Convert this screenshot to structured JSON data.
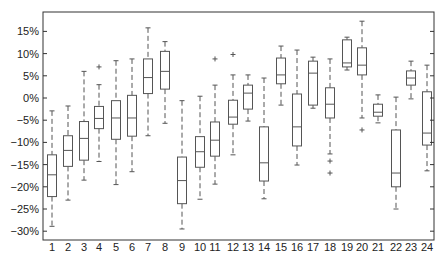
{
  "chart_data": {
    "type": "boxplot",
    "title": "",
    "xlabel": "",
    "ylabel": "",
    "ylim": [
      -32,
      18.5
    ],
    "yticks": [
      15,
      10,
      5,
      0,
      -5,
      -10,
      -15,
      -20,
      -25,
      -30
    ],
    "ytick_labels": [
      "15%",
      "10%",
      "5%",
      "0%",
      "-5%",
      "-10%",
      "-15%",
      "-20%",
      "-25%",
      "-30%"
    ],
    "grid": false,
    "legend": null,
    "categories": [
      "1",
      "2",
      "3",
      "4",
      "5",
      "6",
      "7",
      "8",
      "9",
      "10",
      "11",
      "12",
      "13",
      "14",
      "15",
      "16",
      "17",
      "18",
      "19",
      "20",
      "21",
      "22",
      "23",
      "24"
    ],
    "boxes": [
      {
        "label": "1",
        "whisker_low": -28.9,
        "q1": -22.2,
        "median": -17.3,
        "q3": -12.8,
        "whisker_high": -2.9,
        "outliers": []
      },
      {
        "label": "2",
        "whisker_low": -23.0,
        "q1": -15.4,
        "median": -11.8,
        "q3": -8.5,
        "whisker_high": -1.8,
        "outliers": []
      },
      {
        "label": "3",
        "whisker_low": -18.5,
        "q1": -14.0,
        "median": -9.1,
        "q3": -5.3,
        "whisker_high": 6.0,
        "outliers": []
      },
      {
        "label": "4",
        "whisker_low": -14.3,
        "q1": -6.9,
        "median": -4.6,
        "q3": -1.9,
        "whisker_high": 3.0,
        "outliers": [
          7.0
        ]
      },
      {
        "label": "5",
        "whisker_low": -19.5,
        "q1": -9.3,
        "median": -4.5,
        "q3": -0.6,
        "whisker_high": 8.4,
        "outliers": []
      },
      {
        "label": "6",
        "whisker_low": -16.6,
        "q1": -8.6,
        "median": -4.5,
        "q3": 0.6,
        "whisker_high": 8.8,
        "outliers": []
      },
      {
        "label": "7",
        "whisker_low": -8.5,
        "q1": 1.0,
        "median": 4.6,
        "q3": 8.8,
        "whisker_high": 15.8,
        "outliers": []
      },
      {
        "label": "8",
        "whisker_low": -5.7,
        "q1": 2.0,
        "median": 6.0,
        "q3": 10.5,
        "whisker_high": 12.7,
        "outliers": []
      },
      {
        "label": "9",
        "whisker_low": -29.5,
        "q1": -23.8,
        "median": -18.6,
        "q3": -13.3,
        "whisker_high": -0.6,
        "outliers": []
      },
      {
        "label": "10",
        "whisker_low": -22.8,
        "q1": -15.6,
        "median": -12.1,
        "q3": -8.7,
        "whisker_high": 0.4,
        "outliers": []
      },
      {
        "label": "11",
        "whisker_low": -19.4,
        "q1": -13.1,
        "median": -9.5,
        "q3": -5.4,
        "whisker_high": 2.9,
        "outliers": [
          8.8
        ]
      },
      {
        "label": "12",
        "whisker_low": -12.8,
        "q1": -5.9,
        "median": -4.3,
        "q3": -0.5,
        "whisker_high": 5.2,
        "outliers": [
          9.8
        ]
      },
      {
        "label": "13",
        "whisker_low": -5.2,
        "q1": -2.5,
        "median": 1.1,
        "q3": 2.9,
        "whisker_high": 5.2,
        "outliers": []
      },
      {
        "label": "14",
        "whisker_low": -22.7,
        "q1": -18.7,
        "median": -14.6,
        "q3": -6.5,
        "whisker_high": 4.5,
        "outliers": []
      },
      {
        "label": "15",
        "whisker_low": -1.6,
        "q1": 3.2,
        "median": 5.2,
        "q3": 9.0,
        "whisker_high": 11.7,
        "outliers": []
      },
      {
        "label": "16",
        "whisker_low": -15.1,
        "q1": -10.8,
        "median": -6.5,
        "q3": 0.9,
        "whisker_high": 10.8,
        "outliers": []
      },
      {
        "label": "17",
        "whisker_low": -2.3,
        "q1": -1.6,
        "median": 5.6,
        "q3": 8.3,
        "whisker_high": 9.2,
        "outliers": []
      },
      {
        "label": "18",
        "whisker_low": -12.6,
        "q1": -4.5,
        "median": -1.4,
        "q3": 2.3,
        "whisker_high": 8.8,
        "outliers": [
          -14.2,
          -16.9
        ]
      },
      {
        "label": "19",
        "whisker_low": 6.3,
        "q1": 7.0,
        "median": 7.9,
        "q3": 13.1,
        "whisker_high": 13.7,
        "outliers": []
      },
      {
        "label": "20",
        "whisker_low": -4.5,
        "q1": 5.2,
        "median": 7.4,
        "q3": 11.3,
        "whisker_high": 17.3,
        "outliers": [
          -7.2
        ]
      },
      {
        "label": "21",
        "whisker_low": -5.6,
        "q1": -4.1,
        "median": -3.2,
        "q3": -1.4,
        "whisker_high": 0.7,
        "outliers": []
      },
      {
        "label": "22",
        "whisker_low": -25.0,
        "q1": -20.0,
        "median": -16.9,
        "q3": -7.2,
        "whisker_high": 0.2,
        "outliers": []
      },
      {
        "label": "23",
        "whisker_low": -0.2,
        "q1": 2.9,
        "median": 4.5,
        "q3": 6.1,
        "whisker_high": 8.3,
        "outliers": []
      },
      {
        "label": "24",
        "whisker_low": -16.4,
        "q1": -10.6,
        "median": -7.9,
        "q3": 1.4,
        "whisker_high": 7.4,
        "outliers": []
      }
    ]
  },
  "style": {
    "line_color": "#555555",
    "axis_color": "#333333",
    "background": "#ffffff"
  }
}
